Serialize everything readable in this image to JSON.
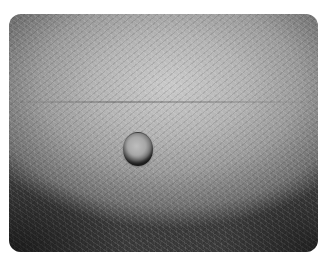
{
  "image": {
    "description": "Grayscale close-up photograph of skin with a small raised dome-shaped nodule",
    "colors": {
      "highlight": "#c9c9c9",
      "midtone": "#9a9a9a",
      "shadow": "#3a3a3a",
      "background": "#ffffff"
    }
  }
}
